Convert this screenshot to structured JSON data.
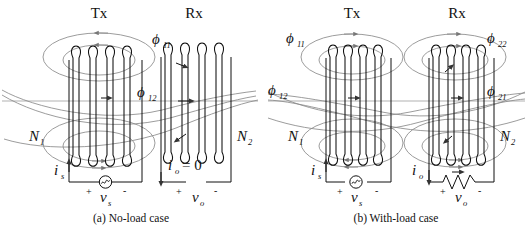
{
  "figure": {
    "title_visible": false,
    "background_color": "#ffffff",
    "line_color": "#111111",
    "flux_color": "#8a8a8a",
    "axis_color": "#a8a8a8"
  },
  "panels": [
    {
      "id": "a",
      "caption": "(a) No-load case",
      "coils": [
        {
          "role": "transmitter",
          "header": "Tx",
          "turns_label": "N",
          "turns_sub": "1"
        },
        {
          "role": "receiver",
          "header": "Rx",
          "turns_label": "N",
          "turns_sub": "2"
        }
      ],
      "flux_labels": [
        {
          "symbol": "ϕ",
          "sub": "11",
          "meaning": "self-flux-tx"
        },
        {
          "symbol": "ϕ",
          "sub": "12",
          "meaning": "mutual-flux-tx-to-rx"
        }
      ],
      "source": {
        "type": "ac-voltage-source",
        "current_label": "i",
        "current_sub": "s",
        "voltage_label": "v",
        "voltage_sub": "s",
        "plus": "+",
        "minus": "-"
      },
      "load": {
        "type": "open-circuit",
        "current_label": "i",
        "current_sub": "o",
        "current_value": "= 0",
        "voltage_label": "v",
        "voltage_sub": "o",
        "plus": "+",
        "minus": "-"
      }
    },
    {
      "id": "b",
      "caption": "(b) With-load case",
      "coils": [
        {
          "role": "transmitter",
          "header": "Tx",
          "turns_label": "N",
          "turns_sub": "1"
        },
        {
          "role": "receiver",
          "header": "Rx",
          "turns_label": "N",
          "turns_sub": "2"
        }
      ],
      "flux_labels": [
        {
          "symbol": "ϕ",
          "sub": "11",
          "meaning": "self-flux-tx"
        },
        {
          "symbol": "ϕ",
          "sub": "22",
          "meaning": "self-flux-rx"
        },
        {
          "symbol": "ϕ",
          "sub": "12",
          "meaning": "mutual-flux-tx-to-rx"
        },
        {
          "symbol": "ϕ",
          "sub": "21",
          "meaning": "mutual-flux-rx-to-tx"
        }
      ],
      "source": {
        "type": "ac-voltage-source",
        "current_label": "i",
        "current_sub": "s",
        "voltage_label": "v",
        "voltage_sub": "s",
        "plus": "+",
        "minus": "-"
      },
      "load": {
        "type": "resistor",
        "current_label": "i",
        "current_sub": "o",
        "voltage_label": "v",
        "voltage_sub": "o",
        "plus": "+",
        "minus": "-"
      }
    }
  ],
  "text": {
    "tx": "Tx",
    "rx": "Rx",
    "phi": "ϕ",
    "n": "N",
    "i": "i",
    "v": "v",
    "sub_11": "11",
    "sub_12": "12",
    "sub_21": "21",
    "sub_22": "22",
    "sub_1": "1",
    "sub_2": "2",
    "sub_s": "s",
    "sub_o": "o",
    "plus": "+",
    "minus": "-",
    "zero_current": "= 0",
    "caption_a": "(a) No-load case",
    "caption_b": "(b) With-load case"
  }
}
